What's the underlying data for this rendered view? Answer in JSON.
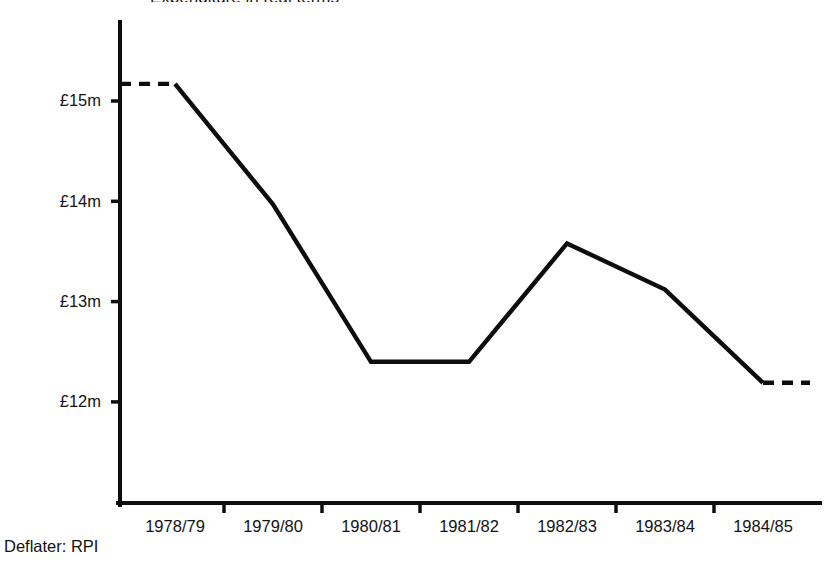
{
  "figure": {
    "footnote": "Deflater: RPI",
    "cropped_title": "Expenditure in real terms",
    "line_color": "#0d0d0d",
    "background_color": "#ffffff"
  },
  "chart_data": {
    "type": "line",
    "title": "",
    "xlabel": "",
    "ylabel": "",
    "categories": [
      "1978/79",
      "1979/80",
      "1980/81",
      "1981/82",
      "1982/83",
      "1983/84",
      "1984/85"
    ],
    "values": [
      15.17,
      13.97,
      12.4,
      12.4,
      13.58,
      13.12,
      12.19
    ],
    "series": [
      {
        "name": "Expenditure (real terms)",
        "values": [
          15.17,
          13.97,
          12.4,
          12.4,
          13.58,
          13.12,
          12.19
        ]
      }
    ],
    "ytick_labels": [
      "£15m",
      "£14m",
      "£13m",
      "£12m"
    ],
    "ytick_values": [
      15,
      14,
      13,
      12
    ],
    "ylim": [
      11.45,
      16.1
    ],
    "grid": false,
    "legend": "none",
    "line_style": "solid with dashed leader at both ends",
    "annotations": [
      "Deflater: RPI"
    ],
    "units": "£ million"
  },
  "axes": {
    "y_ticks": [
      {
        "label": "£15m",
        "value": 15
      },
      {
        "label": "£14m",
        "value": 14
      },
      {
        "label": "£13m",
        "value": 13
      },
      {
        "label": "£12m",
        "value": 12
      }
    ],
    "x_ticks": [
      {
        "label": "1978/79"
      },
      {
        "label": "1979/80"
      },
      {
        "label": "1980/81"
      },
      {
        "label": "1981/82"
      },
      {
        "label": "1982/83"
      },
      {
        "label": "1983/84"
      },
      {
        "label": "1984/85"
      }
    ]
  }
}
